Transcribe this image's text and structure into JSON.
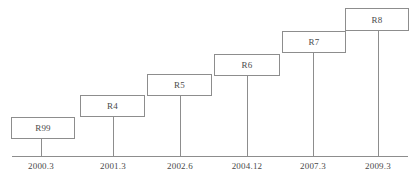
{
  "chart_data": {
    "type": "timeline",
    "title": "",
    "xlabel": "",
    "ylabel": "",
    "orientation": "ascending-staircase",
    "axis": {
      "x_start_px": 12,
      "x_end_px": 408,
      "y_px": 156
    },
    "milestones": [
      {
        "label": "R99",
        "date": "2000.3",
        "box": {
          "x": 11,
          "y": 117,
          "w": 64,
          "h": 22
        },
        "leader_x": 41
      },
      {
        "label": "R4",
        "date": "2001.3",
        "box": {
          "x": 80,
          "y": 95,
          "w": 65,
          "h": 22
        },
        "leader_x": 113
      },
      {
        "label": "R5",
        "date": "2002.6",
        "box": {
          "x": 147,
          "y": 74,
          "w": 65,
          "h": 22
        },
        "leader_x": 180
      },
      {
        "label": "R6",
        "date": "2004.12",
        "box": {
          "x": 214,
          "y": 54,
          "w": 66,
          "h": 22
        },
        "leader_x": 247
      },
      {
        "label": "R7",
        "date": "2007.3",
        "box": {
          "x": 282,
          "y": 31,
          "w": 64,
          "h": 22
        },
        "leader_x": 313
      },
      {
        "label": "R8",
        "date": "2009.3",
        "box": {
          "x": 345,
          "y": 8,
          "w": 64,
          "h": 23
        },
        "leader_x": 378
      }
    ]
  },
  "style": {
    "line_color": "#8d8d8d",
    "text_color": "#4a4a4a",
    "background": "#ffffff"
  }
}
